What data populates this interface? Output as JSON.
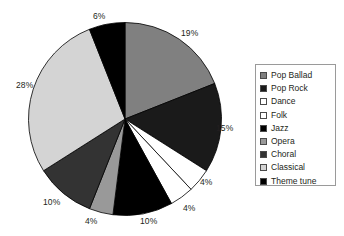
{
  "chart_data": {
    "type": "pie",
    "title": "",
    "categories": [
      "Pop Ballad",
      "Pop Rock",
      "Dance",
      "Folk",
      "Jazz",
      "Opera",
      "Choral",
      "Classical",
      "Theme tune"
    ],
    "values": [
      19,
      15,
      4,
      4,
      10,
      4,
      10,
      28,
      6
    ],
    "value_unit": "%",
    "data_labels": [
      "19%",
      "15%",
      "4%",
      "4%",
      "10%",
      "4%",
      "10%",
      "28%",
      "6%"
    ],
    "colors": [
      "#808080",
      "#1a1a1a",
      "#ffffff",
      "#ffffff",
      "#000000",
      "#999999",
      "#333333",
      "#d4d4d4",
      "#000000"
    ],
    "legend_position": "right",
    "grid": false,
    "start_angle_deg": 0,
    "direction": "clockwise",
    "slice_border_color": "#000000"
  },
  "legend": {
    "items": [
      {
        "label": "Pop Ballad",
        "color": "#808080"
      },
      {
        "label": "Pop Rock",
        "color": "#1a1a1a"
      },
      {
        "label": "Dance",
        "color": "#ffffff"
      },
      {
        "label": "Folk",
        "color": "#ffffff"
      },
      {
        "label": "Jazz",
        "color": "#000000"
      },
      {
        "label": "Opera",
        "color": "#999999"
      },
      {
        "label": "Choral",
        "color": "#333333"
      },
      {
        "label": "Classical",
        "color": "#d4d4d4"
      },
      {
        "label": "Theme tune",
        "color": "#000000"
      }
    ]
  },
  "labels": [
    {
      "text": "6%",
      "x": 93,
      "y": 11
    },
    {
      "text": "19%",
      "x": 181,
      "y": 28
    },
    {
      "text": "15%",
      "x": 216,
      "y": 123
    },
    {
      "text": "4%",
      "x": 200,
      "y": 177
    },
    {
      "text": "4%",
      "x": 183,
      "y": 203
    },
    {
      "text": "10%",
      "x": 140,
      "y": 216
    },
    {
      "text": "4%",
      "x": 85,
      "y": 216
    },
    {
      "text": "10%",
      "x": 43,
      "y": 197
    },
    {
      "text": "28%",
      "x": 16,
      "y": 80
    }
  ]
}
